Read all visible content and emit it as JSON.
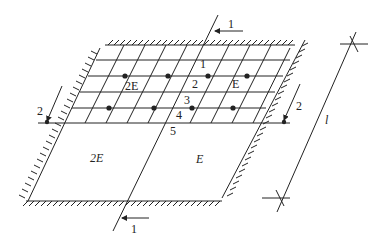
{
  "diagram": {
    "title": "",
    "colors": {
      "line": "#222222",
      "background": "#ffffff"
    },
    "regions": [
      {
        "id": "mesh-left",
        "label": "2E"
      },
      {
        "id": "mesh-right",
        "label": "E"
      },
      {
        "id": "lower-left",
        "label": "2E"
      },
      {
        "id": "lower-right",
        "label": "E"
      }
    ],
    "node_labels": [
      "1",
      "2",
      "3",
      "4",
      "5"
    ],
    "section_markers": {
      "top": "1",
      "bottom": "1",
      "left": "2",
      "right": "2"
    },
    "dimension": {
      "label": "l"
    }
  }
}
